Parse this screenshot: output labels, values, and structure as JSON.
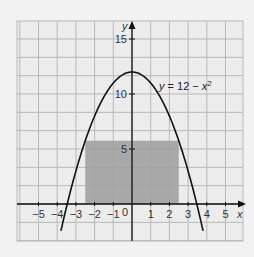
{
  "chart_data": {
    "type": "line",
    "title": "",
    "xlabel": "x",
    "ylabel": "y",
    "xlim": [
      -6.2,
      6
    ],
    "ylim": [
      -4,
      17
    ],
    "grid": true,
    "grid_x_step": 1,
    "grid_y_step": 1.6667,
    "x_ticks": [
      -5,
      -4,
      -3,
      -2,
      -1,
      1,
      2,
      3,
      4,
      5
    ],
    "x_tick_labels": [
      "−5",
      "−4",
      "−3",
      "−2",
      "−1",
      "1",
      "2",
      "3",
      "4",
      "5"
    ],
    "y_ticks": [
      5,
      10,
      15
    ],
    "y_tick_labels": [
      "5",
      "10",
      "15"
    ],
    "origin_label": "0",
    "series": [
      {
        "name": "y = 12 − x²",
        "function": "12 - x^2",
        "x_range": [
          -3.8,
          3.8
        ],
        "color": "#111111"
      }
    ],
    "annotations": [
      {
        "text_parts": [
          "y",
          " = 12 − ",
          "x",
          "2"
        ],
        "x": 1.7,
        "y": 10.8
      }
    ],
    "shaded_rectangle": {
      "x0": -2.5,
      "x1": 2.5,
      "y0": 0,
      "y1": 5.75,
      "color": "#9e9e9e"
    }
  },
  "labels": {
    "x_axis": "x",
    "y_axis": "y",
    "origin": "0",
    "equation_y": "y",
    "equation_mid": " = 12 − ",
    "equation_x": "x",
    "equation_exp": "2"
  }
}
